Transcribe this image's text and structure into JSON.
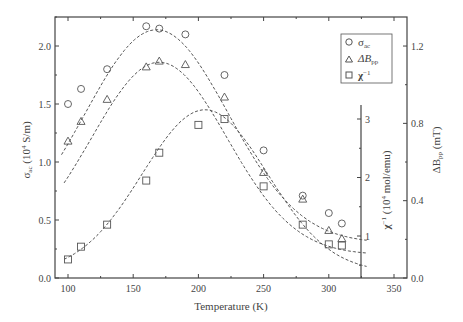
{
  "chart_data": {
    "type": "scatter",
    "title": "",
    "xlabel": "Temperature (K)",
    "ylabel_left": "σac (10⁴ S/m)",
    "ylabel_right": "ΔBpp (mT)",
    "ylabel_inner": "χ⁻¹ (10⁴ mol/emu)",
    "xlim": [
      90,
      360
    ],
    "ylim_left": [
      0.0,
      2.25
    ],
    "ylim_right": [
      0.0,
      1.35
    ],
    "ylim_inner": [
      0.27,
      3.3
    ],
    "x_ticks": [
      100,
      150,
      200,
      250,
      300,
      350
    ],
    "y_ticks_left": [
      0.0,
      0.5,
      1.0,
      1.5,
      2.0
    ],
    "y_ticks_right": [
      0.0,
      0.4,
      0.8,
      1.2
    ],
    "y_ticks_inner": [
      1,
      2,
      3
    ],
    "grid": false,
    "legend_position": "upper right",
    "legend": [
      {
        "marker": "circle",
        "label": "σ",
        "sub": "ac"
      },
      {
        "marker": "triangle",
        "label": "ΔB",
        "sub": "pp"
      },
      {
        "marker": "square",
        "label": "χ",
        "sup": "−1"
      }
    ],
    "series": [
      {
        "name": "sigma_ac",
        "marker": "circle",
        "axis": "left",
        "x": [
          100,
          110,
          130,
          160,
          170,
          190,
          220,
          250,
          280,
          300,
          310
        ],
        "y": [
          1.5,
          1.63,
          1.8,
          2.17,
          2.15,
          2.1,
          1.75,
          1.1,
          0.71,
          0.56,
          0.47
        ],
        "fit": {
          "type": "gaussian",
          "peak_x": 168,
          "peak_y": 2.14,
          "sigma": 55,
          "baseline": 0.3
        }
      },
      {
        "name": "delta_B_pp",
        "marker": "triangle",
        "axis": "right",
        "x": [
          100,
          110,
          130,
          160,
          170,
          190,
          220,
          250,
          280,
          300,
          310
        ],
        "y": [
          0.71,
          0.81,
          0.93,
          1.1,
          1.13,
          1.11,
          0.94,
          0.55,
          0.41,
          0.26,
          0.21
        ],
        "y_left_units": [
          1.18,
          1.35,
          1.54,
          1.82,
          1.87,
          1.84,
          1.56,
          0.91,
          0.68,
          0.41,
          0.34
        ],
        "fit": {
          "type": "gaussian",
          "peak_x": 170,
          "peak_y": 1.86,
          "sigma": 52,
          "baseline": 0.2
        }
      },
      {
        "name": "chi_inverse",
        "marker": "square",
        "axis": "inner",
        "x": [
          100,
          110,
          130,
          160,
          170,
          200,
          220,
          250,
          280,
          300,
          310
        ],
        "y": [
          0.5,
          0.7,
          1.17,
          1.78,
          2.2,
          2.65,
          2.8,
          1.7,
          1.17,
          0.87,
          0.82
        ],
        "y_left_units": [
          0.16,
          0.27,
          0.46,
          0.84,
          1.08,
          1.32,
          1.37,
          0.79,
          0.46,
          0.29,
          0.28
        ],
        "fit": {
          "type": "gaussian",
          "peak_x": 205,
          "peak_y": 1.45,
          "sigma": 48,
          "baseline": 0.05
        }
      }
    ]
  },
  "labels": {
    "xlabel": "Temperature (K)",
    "ylabel_left_main": "σ",
    "ylabel_left_sub": "ac",
    "ylabel_left_unit": " (10",
    "ylabel_left_exp": "4",
    "ylabel_left_tail": " S/m)",
    "ylabel_right_main": "ΔB",
    "ylabel_right_sub": "pp",
    "ylabel_right_tail": " (mT)",
    "ylabel_inner_main": "χ",
    "ylabel_inner_sup": "−1",
    "ylabel_inner_unit": " (10",
    "ylabel_inner_exp": "4",
    "ylabel_inner_tail": " mol/emu)",
    "legend_sigma": "σ",
    "legend_sigma_sub": "ac",
    "legend_dB": "ΔB",
    "legend_dB_sub": "pp",
    "legend_chi": "χ",
    "legend_chi_sup": "−1"
  },
  "ticks": {
    "x": [
      "100",
      "150",
      "200",
      "250",
      "300",
      "350"
    ],
    "left": [
      "0.0",
      "0.5",
      "1.0",
      "1.5",
      "2.0"
    ],
    "right": [
      "0.0",
      "0.4",
      "0.8",
      "1.2"
    ],
    "inner": [
      "1",
      "2",
      "3"
    ]
  }
}
